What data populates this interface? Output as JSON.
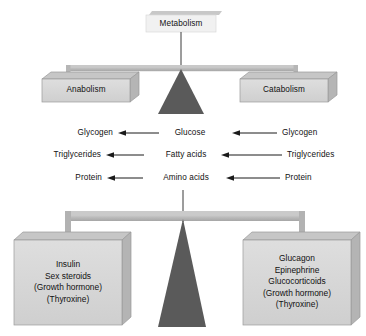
{
  "figure": {
    "type": "balance-diagram"
  },
  "top_scale": {
    "top_box": {
      "label": "Metabolism"
    },
    "left_pan": {
      "label": "Anabolism"
    },
    "right_pan": {
      "label": "Catabolism"
    },
    "fulcrum": {
      "name": "triangle-fulcrum"
    }
  },
  "reactions": {
    "rows": [
      {
        "left": "Glycogen",
        "middle": "Glucose",
        "right": "Glycogen"
      },
      {
        "left": "Triglycerides",
        "middle": "Fatty acids",
        "right": "Triglycerides"
      },
      {
        "left": "Protein",
        "middle": "Amino acids",
        "right": "Protein"
      }
    ],
    "arrow_direction": "left"
  },
  "bottom_scale": {
    "left_pan": {
      "lines": [
        "Insulin",
        "Sex steroids",
        "(Growth hormone)",
        "(Thyroxine)"
      ]
    },
    "right_pan": {
      "lines": [
        "Glucagon",
        "Epinephrine",
        "Glucocorticoids",
        "(Growth hormone)",
        "(Thyroxine)"
      ]
    },
    "fulcrum": {
      "name": "triangle-fulcrum"
    }
  },
  "colors": {
    "box_fill": "#d8d8d8",
    "box_top": "#cfcfcf",
    "box_side": "#bdbdbd",
    "beam": "#b4b4b4",
    "beam_top": "#c9c9c9",
    "fulcrum": "#5a5a5a",
    "outline": "#8a8a8a",
    "text": "#111111",
    "arrow": "#1a1a1a"
  }
}
